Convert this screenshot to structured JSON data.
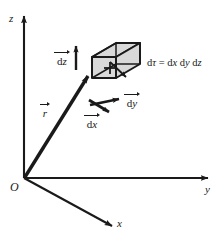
{
  "figure": {
    "background_color": "#ffffff",
    "ink_color": "#1a1a1a",
    "cube_fill_color": "#d9d9d9"
  },
  "axes": [
    {
      "name": "z-axis",
      "label": "z",
      "direction": "up"
    },
    {
      "name": "y-axis",
      "label": "y",
      "direction": "right"
    },
    {
      "name": "x-axis",
      "label": "x",
      "direction": "down-right"
    }
  ],
  "origin": {
    "label": "O"
  },
  "vectors": [
    {
      "name": "position-vector",
      "symbol": "r",
      "overarrow": true
    },
    {
      "name": "dz-vector",
      "prefix": "d",
      "symbol": "z",
      "overarrow": true
    },
    {
      "name": "dy-vector",
      "prefix": "d",
      "symbol": "y",
      "overarrow": true
    },
    {
      "name": "dx-vector",
      "prefix": "d",
      "symbol": "x",
      "overarrow": true
    }
  ],
  "labels": {
    "axis_z": "z",
    "axis_y": "y",
    "axis_x": "x",
    "origin": "O",
    "vec_r_symbol": "r",
    "vec_dz_prefix": "d",
    "vec_dz_symbol": "z",
    "vec_dy_prefix": "d",
    "vec_dy_symbol": "y",
    "vec_dx_prefix": "d",
    "vec_dx_symbol": "x"
  },
  "formula": {
    "name": "volume-element-formula",
    "text": "dτ = dx dy dz",
    "lhs_d": "d",
    "lhs_tau": "τ",
    "equals": "=",
    "term1_d": "d",
    "term1_var": "x",
    "term2_d": "d",
    "term2_var": "y",
    "term3_d": "d",
    "term3_var": "z"
  },
  "volume_element": {
    "name": "volume-element-cube",
    "description": "wireframe parallelepiped representing dx dy dz",
    "fill": "#d9d9d9",
    "stroke": "#1a1a1a"
  }
}
